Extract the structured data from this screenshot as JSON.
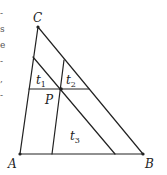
{
  "diagram": {
    "type": "triangle-geometry",
    "vertices": {
      "A": {
        "label": "A",
        "x": 20,
        "y": 154
      },
      "B": {
        "label": "B",
        "x": 143,
        "y": 154
      },
      "C": {
        "label": "C",
        "x": 38,
        "y": 27
      },
      "P": {
        "label": "P",
        "x": 61,
        "y": 89
      }
    },
    "lines_through_P": [
      {
        "name": "parallel-to-AB",
        "x1": 29,
        "y1": 89,
        "x2": 89,
        "y2": 89
      },
      {
        "name": "parallel-to-BC",
        "x1": 33,
        "y1": 57,
        "x2": 115,
        "y2": 154
      },
      {
        "name": "parallel-to-AC",
        "x1": 64,
        "y1": 60,
        "x2": 52,
        "y2": 154
      }
    ],
    "regions": [
      {
        "label": "t",
        "subscript": "1",
        "x": 36,
        "y": 84
      },
      {
        "label": "t",
        "subscript": "2",
        "x": 66,
        "y": 84
      },
      {
        "label": "t",
        "subscript": "3",
        "x": 70,
        "y": 140
      }
    ],
    "stroke_color": "#222222",
    "left_edge_text_fragments": [
      "-",
      "s",
      "e",
      "-",
      ",",
      "-"
    ]
  }
}
